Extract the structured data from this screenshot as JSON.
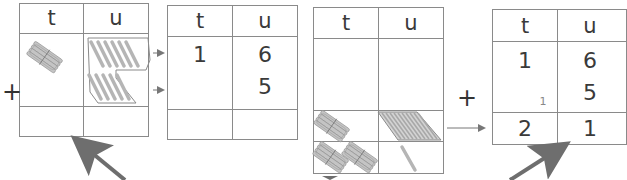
{
  "headers": {
    "tens": "t",
    "units": "u"
  },
  "operator": "+",
  "step1": {
    "description": "base-ten blocks: 1 ten bundle + 11 unit sticks (6 and 5 grouped)",
    "tens_blocks": 1,
    "units_blocks_top": 6,
    "units_blocks_bottom": 5
  },
  "step2": {
    "row1": {
      "t": "1",
      "u": "6"
    },
    "row2": {
      "t": "",
      "u": "5"
    },
    "sum": {
      "t": "",
      "u": ""
    }
  },
  "step3": {
    "description": "regrouped: 10 units become 1 ten; result 2 tens + 1 unit",
    "tens_row1": 1,
    "tens_row2": 2,
    "units_bundle": 10,
    "units_single": 1
  },
  "step4": {
    "row1": {
      "t": "1",
      "u": "6"
    },
    "row2": {
      "t": "",
      "u": "5"
    },
    "carry": "1",
    "sum": {
      "t": "2",
      "u": "1"
    }
  },
  "colors": {
    "line": "#8a8a8a",
    "stick": "#b5b5b5",
    "arrow": "#6e6e6e"
  }
}
